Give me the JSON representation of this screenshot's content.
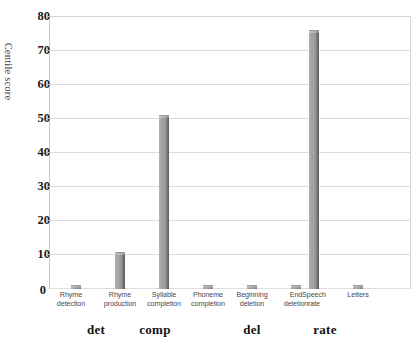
{
  "chart_data": {
    "type": "bar",
    "title": "",
    "xlabel": "",
    "ylabel": "Centile score",
    "ylim": [
      0,
      80
    ],
    "ytick_step": 10,
    "yticks": [
      80,
      70,
      60,
      50,
      40,
      30,
      20,
      10,
      0
    ],
    "grid": true,
    "legend": "none",
    "bar_color": "#a0a0a0",
    "categories": [
      "Rhyme detection",
      "Rhyme production",
      "Syllable completion",
      "Phoneme completion",
      "Beginning deletion",
      "End deletion",
      "Speech rate",
      "Letters"
    ],
    "values": [
      0,
      10,
      50,
      0,
      0,
      0,
      75,
      0
    ],
    "tick_labels": [
      {
        "line1": "Rhyme",
        "line2": "detection"
      },
      {
        "line1": "Rhyme",
        "line2": "production"
      },
      {
        "line1": "Syllable",
        "line2": "completion"
      },
      {
        "line1": "Phoneme",
        "line2": "completion"
      },
      {
        "line1": "Beginning",
        "line2": "deletion"
      },
      {
        "line1": "End",
        "line2": "deletion"
      },
      {
        "line1": "Speech",
        "line2": "rate"
      },
      {
        "line1": "Letters",
        "line2": ""
      }
    ],
    "groups": [
      {
        "label": "det",
        "categories": [
          "Rhyme detection",
          "Rhyme production"
        ]
      },
      {
        "label": "comp",
        "categories": [
          "Syllable completion",
          "Phoneme completion"
        ]
      },
      {
        "label": "del",
        "categories": [
          "Beginning deletion",
          "End deletion"
        ]
      },
      {
        "label": "rate",
        "categories": [
          "Speech rate",
          "Letters"
        ]
      }
    ]
  },
  "axis": {
    "y_title": "Centile score",
    "y_labels": {
      "t80": "80",
      "t70": "70",
      "t60": "60",
      "t50": "50",
      "t40": "40",
      "t30": "30",
      "t20": "20",
      "t10": "10",
      "t0": "0"
    }
  },
  "groups": {
    "g0": "det",
    "g1": "comp",
    "g2": "del",
    "g3": "rate"
  }
}
